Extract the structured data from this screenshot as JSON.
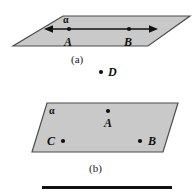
{
  "figure": {
    "background_color": "#ffffff",
    "plane_fill_color": "#c9c9c9",
    "plane_stroke_color": "#4d4d4d",
    "ink_color": "#111111",
    "panels": [
      {
        "id": "panel-a",
        "caption": "(a)",
        "plane_label": "α",
        "points": [
          {
            "name": "A",
            "label": "A"
          },
          {
            "name": "B",
            "label": "B"
          }
        ],
        "line_through_points": true,
        "line_arrows": "both"
      },
      {
        "id": "panel-b",
        "caption": "(b)",
        "plane_label": "α",
        "points": [
          {
            "name": "A",
            "label": "A"
          },
          {
            "name": "C",
            "label": "C"
          },
          {
            "name": "B",
            "label": "B"
          }
        ],
        "line_through_points": false,
        "line_arrows": "none"
      }
    ],
    "external_point": {
      "name": "D",
      "label": "D"
    },
    "rule": {
      "present": true,
      "thickness_px": 3
    }
  }
}
